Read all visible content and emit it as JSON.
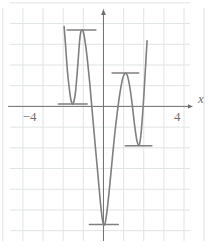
{
  "chart_data": {
    "type": "line",
    "title": "",
    "subtitle": "",
    "xlabel": "x",
    "ylabel": "",
    "grid": true,
    "legend": null,
    "xlim": [
      -5.6,
      6.2
    ],
    "ylim": [
      -7.4,
      5.6
    ],
    "x_ticks": [
      -4,
      4
    ],
    "x_tick_labels": [
      "−4",
      "4"
    ],
    "y_ticks": [],
    "y_tick_labels": [],
    "grid_step": 1.09,
    "axis_color": "#6f6f6f",
    "grid_color": "#dfe4e4",
    "curve_color": "#807f80",
    "tangent_color": "#807f80",
    "series": [
      {
        "name": "polynomial",
        "description": "degree-6 polynomial with four horizontal-tangent extrema",
        "points": [
          [
            -2.13,
            4.2
          ],
          [
            -2.05,
            3.2
          ],
          [
            -1.95,
            1.85
          ],
          [
            -1.85,
            0.95
          ],
          [
            -1.78,
            0.45
          ],
          [
            -1.72,
            0.2
          ],
          [
            -1.66,
            0.12
          ],
          [
            -1.6,
            0.26
          ],
          [
            -1.52,
            0.7
          ],
          [
            -1.44,
            1.55
          ],
          [
            -1.36,
            2.55
          ],
          [
            -1.3,
            3.35
          ],
          [
            -1.24,
            3.85
          ],
          [
            -1.18,
            4.02
          ],
          [
            -1.1,
            3.95
          ],
          [
            -1.0,
            3.45
          ],
          [
            -0.88,
            2.55
          ],
          [
            -0.74,
            1.2
          ],
          [
            -0.6,
            -0.35
          ],
          [
            -0.45,
            -2.0
          ],
          [
            -0.3,
            -3.6
          ],
          [
            -0.18,
            -4.9
          ],
          [
            -0.08,
            -5.8
          ],
          [
            0.0,
            -6.2
          ],
          [
            0.08,
            -6.18
          ],
          [
            0.18,
            -5.6
          ],
          [
            0.3,
            -4.55
          ],
          [
            0.45,
            -3.05
          ],
          [
            0.6,
            -1.55
          ],
          [
            0.75,
            -0.3
          ],
          [
            0.9,
            0.75
          ],
          [
            1.05,
            1.5
          ],
          [
            1.18,
            1.75
          ],
          [
            1.3,
            1.6
          ],
          [
            1.42,
            1.05
          ],
          [
            1.55,
            0.15
          ],
          [
            1.68,
            -0.95
          ],
          [
            1.8,
            -1.75
          ],
          [
            1.9,
            -2.05
          ],
          [
            1.98,
            -1.85
          ],
          [
            2.06,
            -1.15
          ],
          [
            2.16,
            0.15
          ],
          [
            2.26,
            1.8
          ],
          [
            2.36,
            3.45
          ]
        ]
      }
    ],
    "extrema": [
      {
        "kind": "local-min",
        "x": -1.66,
        "y": 0.12,
        "tangent_half_width": 0.78
      },
      {
        "kind": "local-max",
        "x": -1.19,
        "y": 4.02,
        "tangent_half_width": 0.78
      },
      {
        "kind": "global-min",
        "x": 0.02,
        "y": -6.22,
        "tangent_half_width": 0.78
      },
      {
        "kind": "local-max",
        "x": 1.19,
        "y": 1.76,
        "tangent_half_width": 0.72
      },
      {
        "kind": "local-min",
        "x": 1.9,
        "y": -2.07,
        "tangent_half_width": 0.72
      }
    ]
  }
}
